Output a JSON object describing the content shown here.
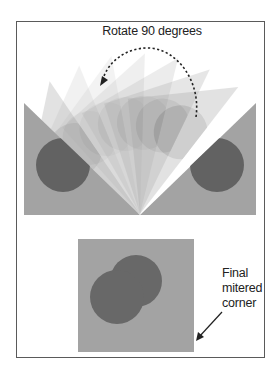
{
  "figure": {
    "title": "Rotate 90 degrees",
    "caption_lines": [
      "Final",
      "mitered",
      "corner"
    ],
    "rotation_degrees": 90
  },
  "colors": {
    "background": "#ffffff",
    "frame_border": "#5a5a5a",
    "base_gray": "#a3a3a3",
    "circle_dark": "#626262",
    "fan_light": "#d6d6d6",
    "arrow": "#222222"
  },
  "shapes": {
    "top_panel": {
      "left_piece": {
        "x": 24,
        "y": 103,
        "apex_x": 140,
        "apex_y": 214,
        "bottom": 215
      },
      "right_piece": {
        "x": 256,
        "y": 103
      },
      "left_circle": {
        "cx": 63,
        "cy": 165,
        "r": 27
      },
      "right_circle": {
        "cx": 217,
        "cy": 165,
        "r": 27
      },
      "fan_angles": [
        12,
        24,
        36,
        48,
        60,
        72,
        84
      ]
    },
    "bottom_panel": {
      "square": {
        "x": 78,
        "y": 239,
        "w": 116,
        "h": 113
      },
      "circle_a": {
        "cx": 136,
        "cy": 281,
        "r": 26
      },
      "circle_b": {
        "cx": 117,
        "cy": 297,
        "r": 27
      }
    }
  }
}
